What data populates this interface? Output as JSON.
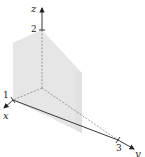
{
  "diagram": {
    "type": "3d-solid-wedge",
    "axes": {
      "x": {
        "label": "x",
        "tick_label": "1"
      },
      "y": {
        "label": "y",
        "tick_label": "3"
      },
      "z": {
        "label": "z",
        "tick_label": "2"
      }
    },
    "colors": {
      "solid_face": "#e4e4e4",
      "solid_top": "#ececec",
      "solid_side": "#dadada",
      "axis": "#222222",
      "hidden_edge": "#777777"
    }
  }
}
